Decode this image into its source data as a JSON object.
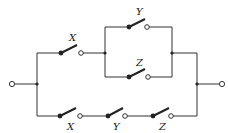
{
  "diagram": {
    "type": "switching-circuit",
    "colors": {
      "wire": "#333333",
      "background": "#ffffff"
    },
    "terminals": [
      {
        "id": "input",
        "x": 12,
        "y": 84
      },
      {
        "id": "output",
        "x": 222,
        "y": 84
      }
    ],
    "upper_path": {
      "series_switch": {
        "label": "X",
        "dot": [
          61,
          53
        ],
        "open": [
          81,
          53
        ],
        "label_pos": [
          72,
          44
        ]
      },
      "parallel_block": {
        "top_switch": {
          "label": "Y",
          "dot": [
            129,
            27
          ],
          "open": [
            147,
            27
          ],
          "label_pos": [
            139,
            17
          ]
        },
        "bottom_switch": {
          "label": "Z",
          "dot": [
            129,
            77
          ],
          "open": [
            148,
            77
          ],
          "label_pos": [
            139,
            67
          ]
        }
      }
    },
    "lower_path": {
      "switches": [
        {
          "label": "X",
          "dot": [
            60,
            116
          ],
          "open": [
            80,
            116
          ],
          "label_pos": [
            70,
            130
          ]
        },
        {
          "label": "Y",
          "dot": [
            108,
            116
          ],
          "open": [
            125,
            116
          ],
          "label_pos": [
            116,
            130
          ]
        },
        {
          "label": "Z",
          "dot": [
            153,
            116
          ],
          "open": [
            171,
            116
          ],
          "label_pos": [
            162,
            130
          ]
        }
      ]
    }
  }
}
